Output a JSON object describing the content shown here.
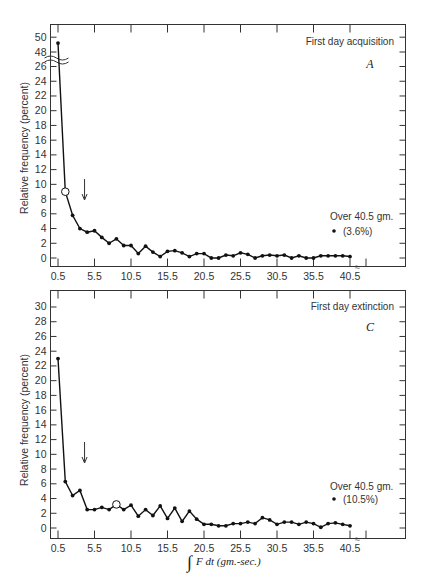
{
  "chart_data": [
    {
      "type": "line",
      "panel": "A",
      "title": "First day acquisition",
      "xlabel": "",
      "ylabel": "Relative frequency (percent)",
      "x_ticks": [
        "0.5",
        "5.5",
        "10.5",
        "15.5",
        "20.5",
        "25.5",
        "30.5",
        "35.5",
        "40.5"
      ],
      "y_ticks_lower": [
        "0",
        "2",
        "4",
        "6",
        "8",
        "10",
        "12",
        "14",
        "16",
        "18",
        "20",
        "22",
        "24",
        "26"
      ],
      "y_ticks_upper": [
        "48",
        "50"
      ],
      "y_break": "between 26 and 48",
      "x": [
        0.5,
        1.5,
        2.5,
        3.5,
        4.5,
        5.5,
        6.5,
        7.5,
        8.5,
        9.5,
        10.5,
        11.5,
        12.5,
        13.5,
        14.5,
        15.5,
        16.5,
        17.5,
        18.5,
        19.5,
        20.5,
        21.5,
        22.5,
        23.5,
        24.5,
        25.5,
        26.5,
        27.5,
        28.5,
        29.5,
        30.5,
        31.5,
        32.5,
        33.5,
        34.5,
        35.5,
        36.5,
        37.5,
        38.5,
        39.5,
        40.5
      ],
      "values": [
        49.2,
        9.0,
        5.8,
        4.0,
        3.5,
        3.7,
        2.8,
        2.0,
        2.6,
        1.7,
        1.7,
        0.6,
        1.6,
        0.8,
        0.2,
        0.9,
        1.0,
        0.7,
        0.2,
        0.6,
        0.6,
        0.0,
        0.0,
        0.4,
        0.3,
        0.7,
        0.5,
        0.0,
        0.3,
        0.4,
        0.3,
        0.4,
        0.0,
        0.3,
        0.0,
        0.0,
        0.3,
        0.3,
        0.3,
        0.3,
        0.2
      ],
      "open_marker_x": 1.5,
      "arrow_x": 4.0,
      "annotation": {
        "text": "Over 40.5 gm.",
        "value_label": "(3.6%)",
        "value": 3.6
      },
      "grid": false
    },
    {
      "type": "line",
      "panel": "C",
      "title": "First day extinction",
      "xlabel": "∫F dt (gm.-sec.)",
      "ylabel": "Relative frequency (percent)",
      "x_ticks": [
        "0.5",
        "5.5",
        "10.5",
        "15.5",
        "20.5",
        "25.5",
        "30.5",
        "35.5",
        "40.5"
      ],
      "y_ticks": [
        "0",
        "2",
        "4",
        "6",
        "8",
        "10",
        "12",
        "14",
        "16",
        "18",
        "20",
        "22",
        "24",
        "26",
        "28",
        "30"
      ],
      "ylim": [
        0,
        30
      ],
      "x": [
        0.5,
        1.5,
        2.5,
        3.5,
        4.5,
        5.5,
        6.5,
        7.5,
        8.5,
        9.5,
        10.5,
        11.5,
        12.5,
        13.5,
        14.5,
        15.5,
        16.5,
        17.5,
        18.5,
        19.5,
        20.5,
        21.5,
        22.5,
        23.5,
        24.5,
        25.5,
        26.5,
        27.5,
        28.5,
        29.5,
        30.5,
        31.5,
        32.5,
        33.5,
        34.5,
        35.5,
        36.5,
        37.5,
        38.5,
        39.5,
        40.5
      ],
      "values": [
        23.0,
        6.3,
        4.4,
        5.1,
        2.5,
        2.5,
        2.8,
        2.5,
        3.2,
        2.5,
        3.1,
        1.6,
        2.5,
        1.7,
        3.0,
        1.3,
        2.7,
        0.9,
        2.3,
        1.2,
        0.5,
        0.5,
        0.3,
        0.3,
        0.6,
        0.6,
        0.8,
        0.6,
        1.4,
        1.1,
        0.5,
        0.8,
        0.8,
        0.5,
        0.8,
        0.6,
        0.1,
        0.6,
        0.7,
        0.5,
        0.3
      ],
      "open_marker_x": 8.5,
      "arrow_x": 4.0,
      "annotation": {
        "text": "Over 40.5 gm.",
        "value_label": "(10.5%)",
        "value": 10.5
      },
      "grid": false
    }
  ],
  "panelA": {
    "title": "First day acquisition",
    "letter": "A",
    "ylabel": "Relative frequency (percent)",
    "over_label": "Over 40.5 gm.",
    "over_value": "(3.6%)"
  },
  "panelC": {
    "title": "First day extinction",
    "letter": "C",
    "ylabel": "Relative frequency (percent)",
    "over_label": "Over 40.5 gm.",
    "over_value": "(10.5%)"
  },
  "xaxis_label": "F dt (gm.-sec.)"
}
